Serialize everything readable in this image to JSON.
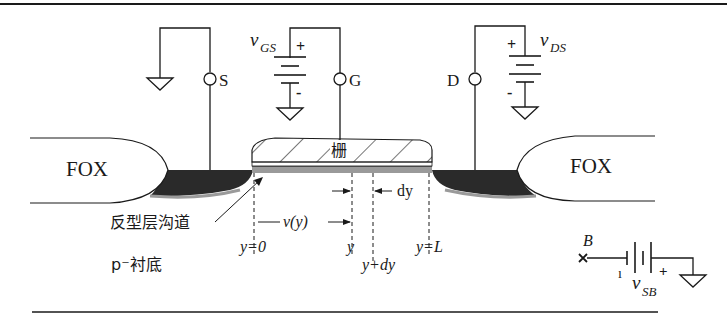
{
  "figure": {
    "terminals": {
      "source": "S",
      "gate": "G",
      "drain": "D",
      "body": "B"
    },
    "sources": {
      "vgs": {
        "symbol": "v",
        "subscript": "GS",
        "plus": "+",
        "minus": "-"
      },
      "vds": {
        "symbol": "v",
        "subscript": "DS",
        "plus": "+",
        "minus": "-"
      },
      "vsb": {
        "symbol": "v",
        "subscript": "SB",
        "plus": "+",
        "minus": "-"
      }
    },
    "regions": {
      "fox_left": "FOX",
      "fox_right": "FOX",
      "gate": "栅",
      "channel": "反型层沟道",
      "substrate": "p⁻衬底"
    },
    "annotations": {
      "vy": "v(y)",
      "dy": "dy",
      "y0": "y=0",
      "y": "y",
      "ydy": "y+dy",
      "yL": "y=L"
    },
    "colors": {
      "line": "#1a1a1a",
      "diffusion": "#2a2a2a",
      "channel": "#9a9a9a",
      "background": "#ffffff"
    }
  }
}
